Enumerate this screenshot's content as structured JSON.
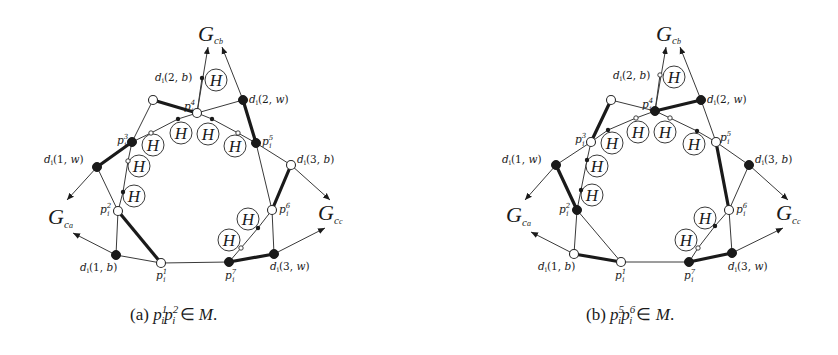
{
  "figure": {
    "panels": [
      {
        "id": "a",
        "caption": {
          "prefix": "(a) ",
          "p": "p",
          "sub1": "i",
          "sup1": "1",
          "sub2": "i",
          "sup2": "2",
          "rel": " ∈ ",
          "set": "M",
          "end": "."
        },
        "graph_labels": {
          "top": {
            "G": "G",
            "sub": "c",
            "subsub": "b"
          },
          "left": {
            "G": "G",
            "sub": "c",
            "subsub": "a"
          },
          "right": {
            "G": "G",
            "sub": "c",
            "subsub": "c"
          }
        },
        "node_labels": {
          "d2b": "d(2, b)",
          "d2w": "d(2, w)",
          "d1w": "d(1, w)",
          "d3b": "d(3, b)",
          "d1b": "d(1, b)",
          "d3w": "d(3, w)",
          "p1": "1",
          "p2": "2",
          "p3": "3",
          "p4": "4",
          "p5": "5",
          "p6": "6",
          "p7": "7"
        },
        "node_colors": {
          "top": "white",
          "p4": "white",
          "d2w": "black",
          "p3": "black",
          "p5": "black",
          "d1w": "black",
          "d3b": "white",
          "p2": "white",
          "p6": "white",
          "d1b": "black",
          "p1": "white",
          "p7": "black",
          "d3w": "black"
        },
        "matching_edges": [
          "top-p4",
          "d2w-p5",
          "d1w-p3",
          "p2-p1",
          "d3b-p6",
          "p7-d3w"
        ],
        "h_gadget_label": "H"
      },
      {
        "id": "b",
        "caption": {
          "prefix": "(b) ",
          "p": "p",
          "sub1": "i",
          "sup1": "5",
          "sub2": "i",
          "sup2": "6",
          "rel": " ∈ ",
          "set": "M",
          "end": "."
        },
        "graph_labels": {
          "top": {
            "G": "G",
            "sub": "c",
            "subsub": "b"
          },
          "left": {
            "G": "G",
            "sub": "c",
            "subsub": "a"
          },
          "right": {
            "G": "G",
            "sub": "c",
            "subsub": "c"
          }
        },
        "node_labels": {
          "d2b": "d(2, b)",
          "d2w": "d(2, w)",
          "d1w": "d(1, w)",
          "d3b": "d(3, b)",
          "d1b": "d(1, b)",
          "d3w": "d(3, w)",
          "p1": "1",
          "p2": "2",
          "p3": "3",
          "p4": "4",
          "p5": "5",
          "p6": "6",
          "p7": "7"
        },
        "node_colors": {
          "top": "white",
          "p4": "black",
          "d2w": "black",
          "p3": "white",
          "p5": "white",
          "d1w": "black",
          "d3b": "black",
          "p2": "black",
          "p6": "white",
          "d1b": "white",
          "p1": "white",
          "p7": "black",
          "d3w": "black"
        },
        "matching_edges": [
          "top-p3",
          "p4-d2w",
          "d1w-p2",
          "d1b-p1",
          "p5-p6",
          "p7-d3w"
        ],
        "h_gadget_label": "H"
      }
    ],
    "node_label_prefix": "d",
    "node_label_index": "i",
    "p_label": "p"
  }
}
